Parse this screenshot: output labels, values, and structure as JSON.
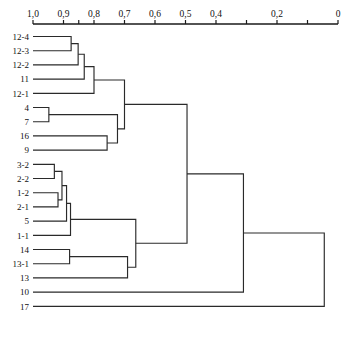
{
  "chart_data": {
    "type": "dendrogram",
    "title": "",
    "xlabel": "",
    "ylabel": "",
    "orientation": "horizontal-right-to-left",
    "grid": false,
    "legend": null,
    "axis": {
      "position": "top",
      "direction": "decreasing-left-to-right",
      "domain_left_value": 1.0,
      "domain_right_value": 0.0,
      "tick_values": [
        1.0,
        0.9,
        0.85,
        0.8,
        0.7,
        0.6,
        0.5,
        0.4,
        0.3,
        0.2,
        0.1,
        0.0
      ],
      "tick_labels": [
        "1,0",
        "0,9",
        "",
        "0,8",
        "0,7",
        "0,6",
        "0,5",
        "0,4",
        "",
        "0,2",
        "",
        "0"
      ],
      "tick_label_texts_visible": [
        "1,0",
        "0,9",
        "0,8",
        "0,7",
        "0,6",
        "0,5",
        "0,4",
        "0,2",
        "0"
      ]
    },
    "leaves": [
      "12-4",
      "12-3",
      "12-2",
      "11",
      "12-1",
      "4",
      "7",
      "16",
      "9",
      "3-2",
      "2-2",
      "1-2",
      "2-1",
      "5",
      "1-1",
      "14",
      "13-1",
      "13",
      "10",
      "17"
    ],
    "n_leaves": 20,
    "merges": [
      {
        "id": "m1",
        "children": [
          "12-4",
          "12-3"
        ],
        "similarity": 0.875,
        "label": "12-4 + 12-3"
      },
      {
        "id": "m2",
        "children": [
          "m1",
          "12-2"
        ],
        "similarity": 0.852,
        "label": "(12-4,12-3) + 12-2"
      },
      {
        "id": "m3",
        "children": [
          "m2",
          "11"
        ],
        "similarity": 0.832,
        "label": "+ 11"
      },
      {
        "id": "m4",
        "children": [
          "m3",
          "12-1"
        ],
        "similarity": 0.8,
        "label": "+ 12-1"
      },
      {
        "id": "m5",
        "children": [
          "4",
          "7"
        ],
        "similarity": 0.948,
        "label": "4 + 7"
      },
      {
        "id": "m6",
        "children": [
          "16",
          "9"
        ],
        "similarity": 0.757,
        "label": "16 + 9"
      },
      {
        "id": "m7",
        "children": [
          "m5",
          "m6"
        ],
        "similarity": 0.723,
        "label": "(4,7) + (16,9)"
      },
      {
        "id": "m8",
        "children": [
          "m4",
          "m7"
        ],
        "similarity": 0.7,
        "label": "upper cluster"
      },
      {
        "id": "m9",
        "children": [
          "3-2",
          "2-2"
        ],
        "similarity": 0.93,
        "label": "3-2 + 2-2"
      },
      {
        "id": "m10",
        "children": [
          "1-2",
          "2-1"
        ],
        "similarity": 0.918,
        "label": "1-2 + 2-1"
      },
      {
        "id": "m11",
        "children": [
          "m9",
          "m10"
        ],
        "similarity": 0.905,
        "label": "(3-2,2-2) + (1-2,2-1)"
      },
      {
        "id": "m12",
        "children": [
          "m11",
          "5"
        ],
        "similarity": 0.89,
        "label": "+ 5"
      },
      {
        "id": "m13",
        "children": [
          "m12",
          "1-1"
        ],
        "similarity": 0.877,
        "label": "+ 1-1"
      },
      {
        "id": "m14",
        "children": [
          "14",
          "13-1"
        ],
        "similarity": 0.88,
        "label": "14 + 13-1"
      },
      {
        "id": "m15",
        "children": [
          "m14",
          "13"
        ],
        "similarity": 0.69,
        "label": "(14,13-1) + 13"
      },
      {
        "id": "m16",
        "children": [
          "m13",
          "m15"
        ],
        "similarity": 0.663,
        "label": "middle cluster"
      },
      {
        "id": "m17",
        "children": [
          "m8",
          "m16"
        ],
        "similarity": 0.495,
        "label": "upper + middle"
      },
      {
        "id": "m18",
        "children": [
          "m17",
          "10"
        ],
        "similarity": 0.31,
        "label": "+ 10"
      },
      {
        "id": "m19",
        "children": [
          "m18",
          "17"
        ],
        "similarity": 0.045,
        "label": "root (+ 17)"
      }
    ]
  },
  "axis": {
    "ticks": [
      {
        "value": 1.0,
        "label": "1,0"
      },
      {
        "value": 0.9,
        "label": "0,9"
      },
      {
        "value": 0.85,
        "label": ""
      },
      {
        "value": 0.8,
        "label": "0,8"
      },
      {
        "value": 0.7,
        "label": "0,7"
      },
      {
        "value": 0.6,
        "label": "0,6"
      },
      {
        "value": 0.5,
        "label": "0,5"
      },
      {
        "value": 0.4,
        "label": "0,4"
      },
      {
        "value": 0.3,
        "label": ""
      },
      {
        "value": 0.2,
        "label": "0,2"
      },
      {
        "value": 0.1,
        "label": ""
      },
      {
        "value": 0.0,
        "label": "0"
      }
    ]
  },
  "colors": {
    "background": "#ffffff",
    "line": "#2a2a2a",
    "axis": "#1a1a1a",
    "text": "#111111"
  }
}
